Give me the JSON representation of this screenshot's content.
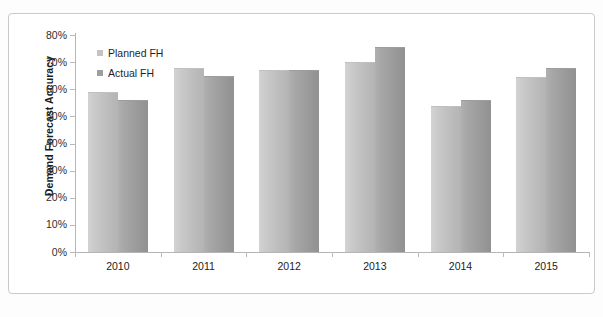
{
  "chart_data": {
    "type": "bar",
    "title": "",
    "subtitle": "",
    "xlabel": "",
    "ylabel": "Demand Forecast Accuracy",
    "categories": [
      "2010",
      "2011",
      "2012",
      "2013",
      "2014",
      "2015"
    ],
    "series": [
      {
        "name": "Planned FH",
        "color": "#c4c4c4",
        "values": [
          59,
          68,
          67,
          70,
          54,
          64.5
        ]
      },
      {
        "name": "Actual FH",
        "color": "#9e9e9e",
        "values": [
          56,
          65,
          67,
          75.5,
          56,
          68
        ]
      }
    ],
    "ylim": [
      0,
      80
    ],
    "ytick_values": [
      80,
      70,
      60,
      50,
      40,
      30,
      20,
      10,
      0
    ],
    "ytick_labels": [
      "80%",
      "70%",
      "60%",
      "50%",
      "40%",
      "30%",
      "20%",
      "10%",
      "0%"
    ],
    "value_suffix": "%",
    "grid": false,
    "legend_position": "top-left",
    "annotations": []
  },
  "frame": {
    "border_color": "#c9c9c9",
    "background": "#ffffff"
  }
}
